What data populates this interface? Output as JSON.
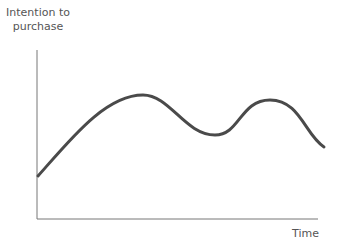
{
  "chart_data": {
    "type": "line",
    "title": "",
    "ylabel": "Intention to purchase",
    "xlabel": "Time",
    "grid": false,
    "legend": null,
    "x": [
      0,
      10,
      20,
      30,
      40,
      50,
      60,
      70,
      80,
      90,
      100
    ],
    "series": [
      {
        "name": "Intention to purchase",
        "values": [
          25,
          44,
          58,
          72,
          72,
          55,
          50,
          68,
          71,
          55,
          42
        ]
      }
    ],
    "xlim": [
      0,
      100
    ],
    "ylim": [
      0,
      100
    ],
    "color": "#4a4a4a",
    "path_pixels": "M38,176 C70,140 105,95 143,95 C170,95 185,135 215,135 C240,135 240,100 270,100 C300,100 305,135 324,147"
  },
  "labels": {
    "y_axis": "Intention to\npurchase",
    "y_line1": "Intention to",
    "y_line2": "purchase",
    "x_axis": "Time"
  }
}
